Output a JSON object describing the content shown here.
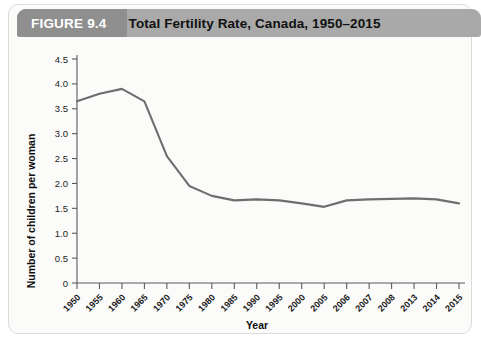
{
  "banner": {
    "figure_number": "FIGURE 9.4",
    "title": "Total Fertility Rate, Canada, 1950–2015",
    "banner_color": "#a9a9a9",
    "accent_color": "#8f8f8f",
    "figure_number_color": "#ffffff",
    "title_color": "#111111"
  },
  "card": {
    "background": "#fbfbfa",
    "border_color": "#dcdcdc"
  },
  "chart_data": {
    "type": "line",
    "title": "Total Fertility Rate, Canada, 1950–2015",
    "xlabel": "Year",
    "ylabel": "Number of children per woman",
    "categories": [
      "1950",
      "1955",
      "1960",
      "1965",
      "1970",
      "1975",
      "1980",
      "1985",
      "1990",
      "1995",
      "2000",
      "2005",
      "2006",
      "2007",
      "2008",
      "2013",
      "2014",
      "2015"
    ],
    "values": [
      3.65,
      3.8,
      3.9,
      3.65,
      2.55,
      1.95,
      1.75,
      1.66,
      1.68,
      1.66,
      1.6,
      1.53,
      1.66,
      1.68,
      1.69,
      1.7,
      1.68,
      1.6
    ],
    "ylim": [
      0,
      4.5
    ],
    "yticks": [
      "0",
      "0.5",
      "1.0",
      "1.5",
      "2.0",
      "2.5",
      "3.0",
      "3.5",
      "4.0",
      "4.5"
    ],
    "ytick_values": [
      0,
      0.5,
      1.0,
      1.5,
      2.0,
      2.5,
      3.0,
      3.5,
      4.0,
      4.5
    ],
    "grid": false,
    "legend": null,
    "series_color": "#6e6e6e",
    "axis_color": "#5a5a5a",
    "xtick_rotation": -45
  }
}
